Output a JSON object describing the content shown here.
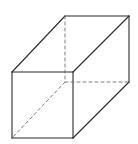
{
  "diagram": {
    "type": "rectangular-prism",
    "stroke_color": "#2b2b2b",
    "hidden_stroke_color": "#6e6e6e",
    "background": "#ffffff",
    "vertices": {
      "front_top_left": [
        12,
        72
      ],
      "front_top_right": [
        73,
        72
      ],
      "front_bottom_left": [
        12,
        138
      ],
      "front_bottom_right": [
        73,
        138
      ],
      "back_top_left": [
        65,
        16
      ],
      "back_top_right": [
        129,
        16
      ],
      "back_bottom_left": [
        65,
        82
      ],
      "back_bottom_right": [
        129,
        82
      ]
    },
    "visible_edges": [
      [
        "front_top_left",
        "front_top_right"
      ],
      [
        "front_top_right",
        "front_bottom_right"
      ],
      [
        "front_bottom_right",
        "front_bottom_left"
      ],
      [
        "front_bottom_left",
        "front_top_left"
      ],
      [
        "front_top_left",
        "back_top_left"
      ],
      [
        "back_top_left",
        "back_top_right"
      ],
      [
        "front_top_right",
        "back_top_right"
      ],
      [
        "back_top_right",
        "back_bottom_right"
      ],
      [
        "front_bottom_right",
        "back_bottom_right"
      ]
    ],
    "hidden_edges": [
      [
        "back_top_left",
        "back_bottom_left"
      ],
      [
        "back_bottom_left",
        "back_bottom_right"
      ],
      [
        "back_bottom_left",
        "front_bottom_left"
      ]
    ]
  }
}
